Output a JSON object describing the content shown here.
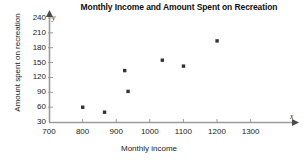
{
  "chart_data": {
    "type": "scatter",
    "title": "Monthly Income and Amount Spent on Recreation",
    "xlabel": "Monthly income",
    "ylabel": "Amount spent on recreation",
    "xlim": [
      700,
      1300
    ],
    "ylim": [
      30,
      250
    ],
    "xticks": [
      700,
      800,
      900,
      1000,
      1100,
      1200,
      1300
    ],
    "yticks": [
      30,
      60,
      90,
      120,
      150,
      180,
      210,
      240
    ],
    "grid": false,
    "legend": null,
    "axis_markers": {
      "x": "x",
      "y": "y"
    },
    "marker_color": "#333333",
    "axis_color": "#9a9a9a",
    "points": [
      {
        "x": 800,
        "y": 60
      },
      {
        "x": 865,
        "y": 50
      },
      {
        "x": 925,
        "y": 134
      },
      {
        "x": 935,
        "y": 92
      },
      {
        "x": 1037,
        "y": 155
      },
      {
        "x": 1100,
        "y": 143
      },
      {
        "x": 1200,
        "y": 194
      }
    ]
  }
}
